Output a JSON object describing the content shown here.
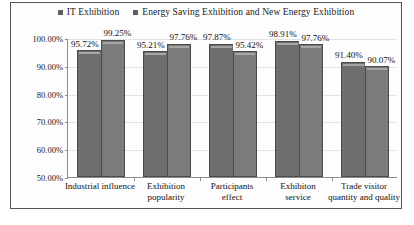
{
  "chart_data": {
    "type": "bar",
    "title": "",
    "xlabel": "",
    "ylabel": "",
    "ylim": [
      50,
      100
    ],
    "ytick_labels": [
      "100.00%",
      "90.00%",
      "80.00%",
      "70.00%",
      "60.00%",
      "50.00%"
    ],
    "ytick_values": [
      100,
      90,
      80,
      70,
      60,
      50
    ],
    "grid": true,
    "legend_position": "top-center",
    "categories": [
      "Industrial influence",
      "Exhibition popularity",
      "Participants effect",
      "Exhibiton service",
      "Trade visitor quantity and quality"
    ],
    "category_lines": [
      [
        "Industrial influence"
      ],
      [
        "Exhibition",
        "popularity"
      ],
      [
        "Participants",
        "effect"
      ],
      [
        "Exhibiton",
        "service"
      ],
      [
        "Trade visitor",
        "quantity and quality"
      ]
    ],
    "series": [
      {
        "name": "IT Exhibition",
        "color": "#6e6e6e",
        "values": [
          95.72,
          95.21,
          97.87,
          98.91,
          91.4
        ],
        "labels": [
          "95.72%",
          "95.21%",
          "97.87%",
          "98.91%",
          "91.40%"
        ]
      },
      {
        "name": "Energy Saving Exhibition and New Energy Exhibition",
        "color": "#7b7b7b",
        "values": [
          99.25,
          97.76,
          95.42,
          97.76,
          90.07
        ],
        "labels": [
          "99.25%",
          "97.76%",
          "95.42%",
          "97.76%",
          "90.07%"
        ]
      }
    ]
  },
  "legend": {
    "entries": [
      {
        "label": "IT Exhibition",
        "swatch": "legend-swatch-it"
      },
      {
        "label": "Energy Saving Exhibition and New Energy Exhibition",
        "swatch": "legend-swatch-energy"
      }
    ]
  }
}
